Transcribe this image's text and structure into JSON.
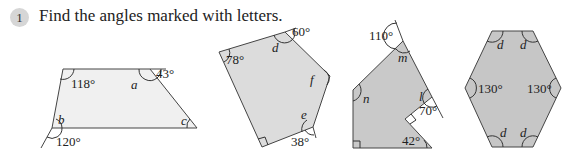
{
  "question": {
    "number": "1",
    "prompt": "Find the angles marked with letters."
  },
  "colors": {
    "fill_1": "#f0f0f0",
    "fill_2": "#dcdcdc",
    "fill_3": "#c9c9c9",
    "fill_4": "#c6c6c6",
    "badge": "#d6d6d6"
  },
  "figures": [
    {
      "name": "trapezium",
      "labels": {
        "a1": "118°",
        "a2": "a",
        "a3": "43°",
        "a4": "b",
        "a5": "120°",
        "a6": "c"
      }
    },
    {
      "name": "pentagon",
      "labels": {
        "a1": "78°",
        "a2": "d",
        "a3": "60°",
        "a4": "f",
        "a5": "e",
        "a6": "38°"
      }
    },
    {
      "name": "notched-polygon",
      "labels": {
        "a1": "110°",
        "a2": "m",
        "a3": "n",
        "a4": "l",
        "a5": "70°",
        "a6": "42°"
      }
    },
    {
      "name": "hexagon",
      "labels": {
        "a1": "d",
        "a2": "d",
        "a3": "130°",
        "a4": "130°",
        "a5": "d",
        "a6": "d"
      }
    }
  ]
}
